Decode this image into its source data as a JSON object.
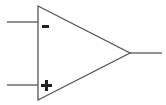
{
  "diagram": {
    "component": "operational amplifier",
    "inverting_input_label": "-",
    "non_inverting_input_label": "+",
    "line_color": "#555555",
    "sign_color": "#222222"
  }
}
